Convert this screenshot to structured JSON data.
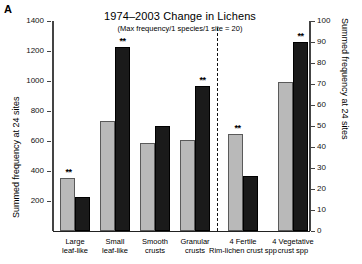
{
  "panel": {
    "letter": "A"
  },
  "header": {
    "title": "1974–2003 Change in Lichens",
    "subtitle": "(Max frequency/1 species/1 site = 20)"
  },
  "axes": {
    "left": {
      "label": "Summed frequency at 24 sites",
      "ticks": [
        200,
        400,
        600,
        800,
        1000,
        1200,
        1400
      ],
      "min": 0,
      "max": 1400
    },
    "right": {
      "label": "Summed frequency at 24 sites",
      "ticks": [
        0,
        10,
        20,
        30,
        40,
        50,
        60,
        70,
        80,
        90,
        100
      ],
      "min": 0,
      "max": 100
    }
  },
  "divider": {
    "style": "dashed"
  },
  "significance": {
    "marker": "**"
  },
  "chart_data": {
    "type": "bar",
    "title": "1974–2003 Change in Lichens",
    "subtitle": "(Max frequency/1 species/1 site = 20)",
    "xlabel": "",
    "ylabel": "Summed frequency at 24 sites",
    "ylim": [
      0,
      1400
    ],
    "y2label": "Summed frequency at 24 sites",
    "y2lim": [
      0,
      100
    ],
    "grid": false,
    "legend": "none",
    "categories": [
      "Large leaf-like",
      "Small leaf-like",
      "Smooth crusts",
      "Granular crusts",
      "4 Fertile Rim-lichen crust spp",
      "4 Vegetative crust spp"
    ],
    "category_lines": [
      [
        "Large",
        "leaf-like"
      ],
      [
        "Small",
        "leaf-like"
      ],
      [
        "Smooth",
        "crusts"
      ],
      [
        "Granular",
        "crusts"
      ],
      [
        "4 Fertile",
        "Rim-lichen crust spp"
      ],
      [
        "4 Vegetative",
        "crust spp"
      ]
    ],
    "series": [
      {
        "name": "1974",
        "color": "#b9b9b9",
        "values": [
          355,
          735,
          585,
          610,
          46,
          71
        ]
      },
      {
        "name": "2003",
        "color": "#1a1a1a",
        "values": [
          230,
          1230,
          700,
          970,
          26,
          90
        ]
      }
    ],
    "axis_assignment": [
      "left",
      "left",
      "left",
      "left",
      "right",
      "right"
    ],
    "significance_flags": [
      true,
      true,
      false,
      true,
      true,
      true
    ],
    "significance_on": [
      "group",
      "group",
      "none",
      "group",
      "group",
      "group"
    ]
  }
}
